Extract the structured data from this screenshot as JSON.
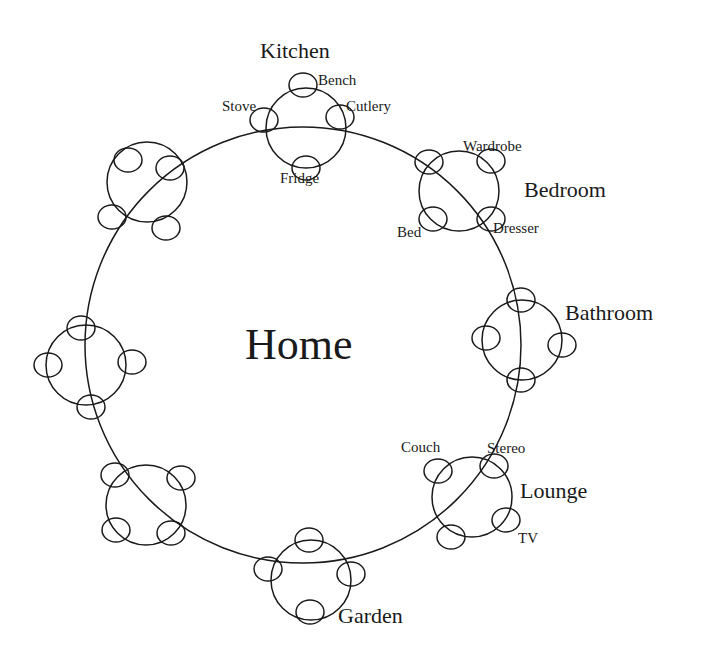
{
  "diagram": {
    "center_label": "Home",
    "main_circle": {
      "cx": 303,
      "cy": 345,
      "r": 218
    },
    "rooms": [
      {
        "name": "Kitchen",
        "cx": 306,
        "cy": 128,
        "r": 40,
        "satellites": [
          {
            "label": "Bench",
            "cx": 303,
            "cy": 85
          },
          {
            "label": "Stove",
            "cx": 264,
            "cy": 120
          },
          {
            "label": "Cutlery",
            "cx": 340,
            "cy": 117
          },
          {
            "label": "Fridge",
            "cx": 306,
            "cy": 168
          }
        ]
      },
      {
        "name": "Bedroom",
        "cx": 459,
        "cy": 191,
        "r": 40,
        "satellites": [
          {
            "label": "",
            "cx": 429,
            "cy": 162
          },
          {
            "label": "Wardrobe",
            "cx": 491,
            "cy": 161
          },
          {
            "label": "Bed",
            "cx": 433,
            "cy": 219
          },
          {
            "label": "Dresser",
            "cx": 491,
            "cy": 219
          }
        ]
      },
      {
        "name": "Bathroom",
        "cx": 522,
        "cy": 340,
        "r": 40,
        "satellites": [
          {
            "label": "",
            "cx": 521,
            "cy": 300
          },
          {
            "label": "",
            "cx": 486,
            "cy": 338
          },
          {
            "label": "",
            "cx": 562,
            "cy": 345
          },
          {
            "label": "",
            "cx": 521,
            "cy": 380
          }
        ]
      },
      {
        "name": "Lounge",
        "cx": 472,
        "cy": 497,
        "r": 40,
        "satellites": [
          {
            "label": "Couch",
            "cx": 438,
            "cy": 471
          },
          {
            "label": "Stereo",
            "cx": 494,
            "cy": 466
          },
          {
            "label": "TV",
            "cx": 506,
            "cy": 520
          },
          {
            "label": "",
            "cx": 451,
            "cy": 537
          }
        ]
      },
      {
        "name": "Garden",
        "cx": 311,
        "cy": 580,
        "r": 40,
        "satellites": [
          {
            "label": "",
            "cx": 309,
            "cy": 540
          },
          {
            "label": "",
            "cx": 268,
            "cy": 569
          },
          {
            "label": "",
            "cx": 351,
            "cy": 574
          },
          {
            "label": "",
            "cx": 310,
            "cy": 612
          }
        ]
      },
      {
        "name": "",
        "cx": 146,
        "cy": 505,
        "r": 40,
        "satellites": [
          {
            "label": "",
            "cx": 115,
            "cy": 475
          },
          {
            "label": "",
            "cx": 181,
            "cy": 478
          },
          {
            "label": "",
            "cx": 116,
            "cy": 530
          },
          {
            "label": "",
            "cx": 171,
            "cy": 533
          }
        ]
      },
      {
        "name": "",
        "cx": 86,
        "cy": 365,
        "r": 40,
        "satellites": [
          {
            "label": "",
            "cx": 81,
            "cy": 328
          },
          {
            "label": "",
            "cx": 48,
            "cy": 365
          },
          {
            "label": "",
            "cx": 132,
            "cy": 362
          },
          {
            "label": "",
            "cx": 91,
            "cy": 407
          }
        ]
      },
      {
        "name": "",
        "cx": 147,
        "cy": 182,
        "r": 40,
        "satellites": [
          {
            "label": "",
            "cx": 128,
            "cy": 160
          },
          {
            "label": "",
            "cx": 170,
            "cy": 168
          },
          {
            "label": "",
            "cx": 112,
            "cy": 217
          },
          {
            "label": "",
            "cx": 166,
            "cy": 228
          }
        ]
      }
    ],
    "labels": {
      "home": "Home",
      "kitchen": "Kitchen",
      "bench": "Bench",
      "stove": "Stove",
      "cutlery": "Cutlery",
      "fridge": "Fridge",
      "bedroom": "Bedroom",
      "wardrobe": "Wardrobe",
      "bed": "Bed",
      "dresser": "Dresser",
      "bathroom": "Bathroom",
      "lounge": "Lounge",
      "couch": "Couch",
      "stereo": "Stereo",
      "tv": "TV",
      "garden": "Garden"
    },
    "stroke_color": "#1a1a1a",
    "background": "#ffffff"
  }
}
